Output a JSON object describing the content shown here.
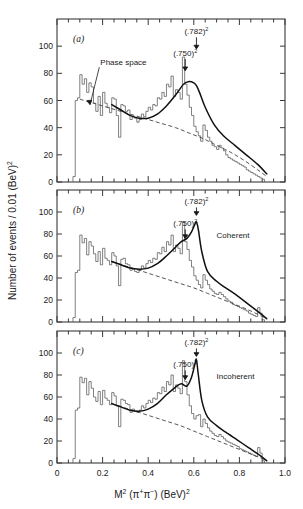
{
  "figure": {
    "axis_titles": {
      "y": "Number of events / 0.01  (BeV)",
      "y_sup": "2",
      "x_main": "M",
      "x_main_sup": "2",
      "x_particles": "(π",
      "x_particles_sup1": "+",
      "x_particles_mid": "π",
      "x_particles_sup2": "−",
      "x_particles_end": ")",
      "x_units": "(BeV)",
      "x_units_sup": "2"
    },
    "x_ticks": [
      "0",
      "0.2",
      "0.4",
      "0.6",
      "0.8",
      "1.0"
    ],
    "x_tick_values": [
      0,
      0.2,
      0.4,
      0.6,
      0.8,
      1.0
    ],
    "y_ticks": [
      "0",
      "20",
      "40",
      "60",
      "80",
      "100"
    ],
    "y_tick_values": [
      0,
      20,
      40,
      60,
      80,
      100
    ],
    "colors": {
      "frame": "#3a3a3a",
      "histogram": "#555555",
      "fit_curve": "#111111",
      "background_curve": "#444444",
      "text": "#1a1a1a",
      "paper": "#ffffff"
    }
  },
  "annotations": {
    "rho_label": "(.750)",
    "rho_sup": "2",
    "omega_label": "(.782)",
    "omega_sup": "2",
    "phase_space": "Phase space",
    "coherent": "Coherent",
    "incoherent": "Incoherent"
  },
  "chart_data": {
    "type": "line",
    "title": "",
    "xlabel": "M² (π⁺π⁻)  (BeV)²",
    "ylabel": "Number of events / 0.01 (BeV)²",
    "xlim": [
      0.0,
      1.0
    ],
    "ylim": [
      0,
      120
    ],
    "grid": false,
    "legend_position": "none",
    "bin_width": 0.01,
    "resonance_markers": [
      {
        "label": "(.750)²",
        "x": 0.5625,
        "panels": [
          "a",
          "b",
          "c"
        ]
      },
      {
        "label": "(.782)²",
        "x": 0.6115,
        "panels": [
          "a",
          "b",
          "c"
        ]
      }
    ],
    "panels": [
      {
        "id": "a",
        "label": "(a)",
        "caption": "",
        "x_start": 0.07,
        "histogram_values": [
          4,
          60,
          62,
          79,
          72,
          76,
          66,
          73,
          70,
          58,
          52,
          63,
          49,
          66,
          58,
          55,
          51,
          62,
          61,
          49,
          33,
          57,
          56,
          52,
          53,
          46,
          48,
          47,
          44,
          46,
          50,
          48,
          52,
          55,
          53,
          57,
          56,
          62,
          61,
          66,
          63,
          72,
          70,
          78,
          63,
          68,
          66,
          61,
          92,
          72,
          64,
          55,
          49,
          41,
          37,
          34,
          30,
          42,
          38,
          33,
          30,
          27,
          26,
          24,
          27,
          25,
          23,
          20,
          18,
          17,
          16,
          15,
          14,
          13,
          12,
          11,
          9,
          8,
          7,
          6,
          5,
          4,
          3,
          2
        ],
        "fit_curve": {
          "x": [
            0.24,
            0.28,
            0.32,
            0.36,
            0.4,
            0.44,
            0.48,
            0.52,
            0.555,
            0.58,
            0.6,
            0.6115,
            0.625,
            0.65,
            0.69,
            0.73,
            0.78,
            0.83,
            0.88,
            0.92
          ],
          "y": [
            57,
            53,
            49,
            47,
            47,
            50,
            56,
            64,
            72,
            74,
            73,
            71,
            66,
            55,
            42,
            34,
            27,
            20,
            13,
            6
          ]
        },
        "background_curve": {
          "x": [
            0.1,
            0.16,
            0.22,
            0.28,
            0.34,
            0.4,
            0.46,
            0.52,
            0.58,
            0.64,
            0.7,
            0.76,
            0.82,
            0.88,
            0.92
          ],
          "y": [
            61,
            58,
            55,
            52,
            49,
            46,
            43,
            40,
            36,
            32,
            27,
            22,
            16,
            9,
            4
          ]
        },
        "phase_space_arrow_tip": {
          "x": 0.145,
          "y": 57
        }
      },
      {
        "id": "b",
        "label": "(b)",
        "caption": "Coherent",
        "x_start": 0.07,
        "histogram_values": [
          4,
          45,
          47,
          79,
          72,
          76,
          61,
          73,
          69,
          62,
          55,
          64,
          52,
          67,
          58,
          56,
          52,
          63,
          60,
          51,
          33,
          57,
          58,
          53,
          52,
          47,
          48,
          46,
          45,
          47,
          51,
          49,
          53,
          56,
          54,
          58,
          57,
          63,
          62,
          68,
          64,
          73,
          70,
          79,
          64,
          70,
          67,
          62,
          91,
          73,
          66,
          56,
          50,
          42,
          38,
          34,
          31,
          43,
          38,
          34,
          30,
          28,
          26,
          25,
          27,
          25,
          23,
          21,
          19,
          18,
          16,
          15,
          14,
          13,
          12,
          11,
          10,
          8,
          7,
          6,
          5,
          13,
          8,
          2
        ],
        "fit_curve": {
          "x": [
            0.24,
            0.28,
            0.32,
            0.36,
            0.4,
            0.44,
            0.48,
            0.52,
            0.545,
            0.57,
            0.59,
            0.605,
            0.6115,
            0.62,
            0.635,
            0.66,
            0.7,
            0.74,
            0.79,
            0.84,
            0.89,
            0.92
          ],
          "y": [
            55,
            52,
            49,
            48,
            49,
            53,
            60,
            68,
            73,
            76,
            82,
            89,
            91,
            84,
            64,
            46,
            37,
            31,
            24,
            16,
            8,
            3
          ]
        },
        "background_curve": {
          "x": [
            0.24,
            0.3,
            0.36,
            0.42,
            0.48,
            0.54,
            0.6,
            0.66,
            0.72,
            0.78,
            0.84,
            0.9,
            0.92
          ],
          "y": [
            55,
            51,
            47,
            43,
            39,
            35,
            31,
            26,
            21,
            16,
            11,
            5,
            3
          ]
        }
      },
      {
        "id": "c",
        "label": "(c)",
        "caption": "Incoherent",
        "x_start": 0.07,
        "histogram_values": [
          4,
          48,
          50,
          78,
          73,
          77,
          62,
          74,
          68,
          60,
          56,
          65,
          53,
          66,
          59,
          57,
          53,
          64,
          61,
          52,
          33,
          58,
          57,
          54,
          53,
          46,
          49,
          47,
          46,
          48,
          52,
          50,
          54,
          57,
          55,
          59,
          58,
          64,
          63,
          69,
          65,
          74,
          71,
          80,
          65,
          71,
          68,
          63,
          93,
          74,
          62,
          52,
          45,
          40,
          43,
          44,
          33,
          40,
          36,
          32,
          29,
          27,
          25,
          24,
          26,
          24,
          22,
          20,
          19,
          18,
          17,
          16,
          15,
          13,
          12,
          11,
          10,
          9,
          8,
          7,
          6,
          14,
          9,
          2
        ],
        "fit_curve": {
          "x": [
            0.24,
            0.28,
            0.32,
            0.36,
            0.4,
            0.44,
            0.48,
            0.52,
            0.545,
            0.57,
            0.59,
            0.605,
            0.6115,
            0.62,
            0.635,
            0.66,
            0.7,
            0.74,
            0.79,
            0.84,
            0.89,
            0.92
          ],
          "y": [
            54,
            51,
            48,
            47,
            49,
            54,
            62,
            69,
            72,
            70,
            78,
            90,
            94,
            80,
            57,
            42,
            34,
            28,
            21,
            14,
            7,
            2
          ]
        },
        "background_curve": {
          "x": [
            0.24,
            0.3,
            0.36,
            0.42,
            0.48,
            0.54,
            0.6,
            0.66,
            0.72,
            0.78,
            0.84,
            0.9,
            0.92
          ],
          "y": [
            54,
            50,
            46,
            42,
            38,
            34,
            29,
            24,
            19,
            14,
            9,
            4,
            2
          ]
        }
      }
    ]
  }
}
